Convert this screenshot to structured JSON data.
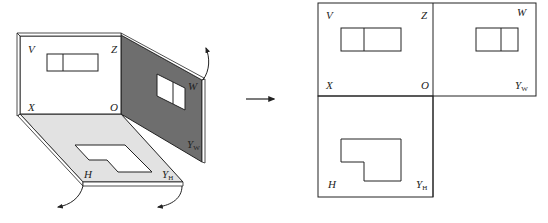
{
  "figure": {
    "left": {
      "title": "3D projection planes (unfolding)",
      "planes": {
        "V": {
          "label": "V",
          "fill": "#ffffff"
        },
        "W": {
          "label": "W",
          "fill": "#6e6e6e"
        },
        "H": {
          "label": "H",
          "fill": "#e2e2e2"
        }
      },
      "axis_labels": {
        "V": "V",
        "Z": "Z",
        "X": "X",
        "O": "O",
        "W": "W",
        "Yw_main": "Y",
        "Yw_sub": "W",
        "H": "H",
        "Yh_main": "Y",
        "Yh_sub": "H"
      }
    },
    "arrow": {
      "direction": "right"
    },
    "right": {
      "title": "Unfolded three-view projection",
      "axis_labels": {
        "V": "V",
        "Z": "Z",
        "W": "W",
        "X": "X",
        "O": "O",
        "Yw_main": "Y",
        "Yw_sub": "W",
        "H": "H",
        "Yh_main": "Y",
        "Yh_sub": "H"
      }
    },
    "colors": {
      "stroke": "#222222",
      "w_plane": "#6e6e6e",
      "h_plane": "#e2e2e2"
    }
  }
}
